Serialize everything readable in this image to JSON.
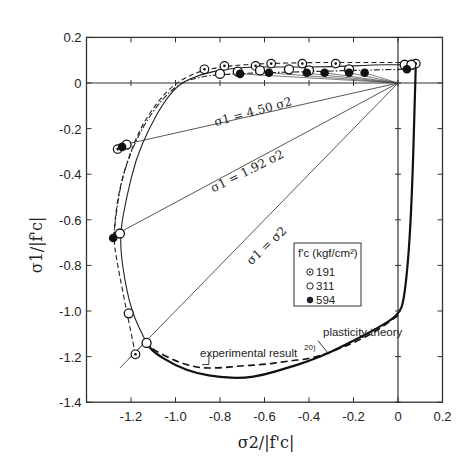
{
  "chart_data": {
    "type": "line",
    "title": "",
    "xlabel": "σ2/|f'c|",
    "ylabel": "σ1/|f'c|",
    "xlim": [
      -1.4,
      0.2
    ],
    "ylim": [
      -1.4,
      0.2
    ],
    "x_ticks": [
      "-1.2",
      "-1.0",
      "-0.8",
      "-0.6",
      "-0.4",
      "-0.2",
      "0",
      "0.2"
    ],
    "x_tick_values": [
      -1.2,
      -1.0,
      -0.8,
      -0.6,
      -0.4,
      -0.2,
      0,
      0.2
    ],
    "y_ticks": [
      "0.2",
      "0",
      "-0.2",
      "-0.4",
      "-0.6",
      "-0.8",
      "-1.0",
      "-1.2",
      "-1.4"
    ],
    "y_tick_values": [
      0.2,
      0,
      -0.2,
      -0.4,
      -0.6,
      -0.8,
      -1.0,
      -1.2,
      -1.4
    ],
    "grid": false,
    "legend": {
      "title": "f'c (kgf/cm²)",
      "position": "lower-right-inside",
      "entries": [
        {
          "label": "191",
          "marker": "dotted-circle"
        },
        {
          "label": "311",
          "marker": "open-circle"
        },
        {
          "label": "594",
          "marker": "filled-circle"
        }
      ]
    },
    "radial_lines": [
      {
        "label": "σ1 = 4.50 σ2",
        "slope": 4.5
      },
      {
        "label": "σ1 = 1.92 σ2",
        "slope": 1.92
      },
      {
        "label": "σ1 = σ2",
        "slope": 1.0
      }
    ],
    "annotations": [
      {
        "text": "plasticity theory",
        "x": -0.42,
        "y": -1.1
      },
      {
        "text": "experimental result",
        "superscript": "20)",
        "x": -0.75,
        "y": -1.17
      }
    ],
    "series": [
      {
        "name": "plasticity theory",
        "style": "solid-thick",
        "x": [
          0.08,
          0.06,
          0.03,
          0.0,
          -0.1,
          -0.2,
          -0.3,
          -0.4,
          -0.5,
          -0.6,
          -0.7,
          -0.8,
          -0.9,
          -1.0,
          -1.1,
          -1.13
        ],
        "y": [
          0.08,
          -0.6,
          -0.95,
          -1.02,
          -1.08,
          -1.13,
          -1.18,
          -1.22,
          -1.25,
          -1.28,
          -1.295,
          -1.29,
          -1.275,
          -1.24,
          -1.18,
          -1.14
        ]
      },
      {
        "name": "experimental result 20)",
        "style": "dashed",
        "x": [
          0.0,
          -0.1,
          -0.2,
          -0.3,
          -0.4,
          -0.5,
          -0.6,
          -0.7,
          -0.8,
          -0.9,
          -1.0,
          -1.1,
          -1.13
        ],
        "y": [
          -1.02,
          -1.09,
          -1.14,
          -1.18,
          -1.21,
          -1.22,
          -1.235,
          -1.24,
          -1.25,
          -1.25,
          -1.22,
          -1.17,
          -1.14
        ]
      },
      {
        "name": "envelope 191 (dash)",
        "style": "dashed-thin",
        "x": [
          -1.18,
          -1.22,
          -1.26,
          -1.28,
          -1.26,
          -1.22,
          -1.16,
          -1.08,
          -1.0,
          -0.9,
          -0.8,
          -0.7,
          -0.6,
          -0.4,
          -0.2,
          0.0,
          0.05,
          0.09
        ],
        "y": [
          -1.19,
          -1.0,
          -0.8,
          -0.68,
          -0.5,
          -0.35,
          -0.2,
          -0.08,
          0.0,
          0.05,
          0.07,
          0.08,
          0.085,
          0.09,
          0.09,
          0.09,
          0.09,
          0.09
        ]
      },
      {
        "name": "envelope 311 (solid)",
        "style": "solid-thin",
        "x": [
          -1.13,
          -1.2,
          -1.24,
          -1.25,
          -1.22,
          -1.18,
          -1.12,
          -1.05,
          -0.98,
          -0.88,
          -0.78,
          -0.68,
          -0.5,
          -0.3,
          -0.1,
          0.0,
          0.04,
          0.09
        ],
        "y": [
          -1.14,
          -1.0,
          -0.8,
          -0.66,
          -0.5,
          -0.34,
          -0.2,
          -0.08,
          0.0,
          0.04,
          0.06,
          0.07,
          0.07,
          0.07,
          0.08,
          0.08,
          0.08,
          0.08
        ]
      },
      {
        "name": "envelope 594 (dash-dot)",
        "style": "dash-dot",
        "x": [
          -1.28,
          -1.25,
          -1.2,
          -1.14,
          -1.06,
          -0.98,
          -0.88,
          -0.75,
          -0.6,
          -0.4,
          -0.2,
          0.0,
          0.07
        ],
        "y": [
          -0.68,
          -0.45,
          -0.3,
          -0.18,
          -0.07,
          0.0,
          0.03,
          0.04,
          0.045,
          0.05,
          0.055,
          0.06,
          0.06
        ]
      },
      {
        "name": "191 data",
        "marker": "dotted-circle",
        "x": [
          -0.87,
          -0.78,
          -0.64,
          -0.57,
          -0.43,
          -0.28,
          0.08,
          -1.26,
          -1.18
        ],
        "y": [
          0.06,
          0.075,
          0.075,
          0.085,
          0.085,
          0.085,
          0.085,
          -0.29,
          -1.19
        ]
      },
      {
        "name": "311 data",
        "marker": "open-circle",
        "x": [
          -0.8,
          -0.72,
          -0.62,
          -0.49,
          -0.4,
          -0.22,
          0.03,
          0.06,
          -1.22,
          -1.25,
          -1.21,
          -1.13
        ],
        "y": [
          0.04,
          0.05,
          0.055,
          0.06,
          0.055,
          0.06,
          0.08,
          0.08,
          -0.27,
          -0.66,
          -1.01,
          -1.14
        ]
      },
      {
        "name": "594 data",
        "marker": "filled-circle",
        "x": [
          -0.71,
          -0.58,
          -0.41,
          -0.33,
          -0.22,
          -0.15,
          0.04,
          -1.24,
          -1.28
        ],
        "y": [
          0.04,
          0.045,
          0.045,
          0.045,
          0.045,
          0.045,
          0.06,
          -0.28,
          -0.68
        ]
      }
    ]
  }
}
